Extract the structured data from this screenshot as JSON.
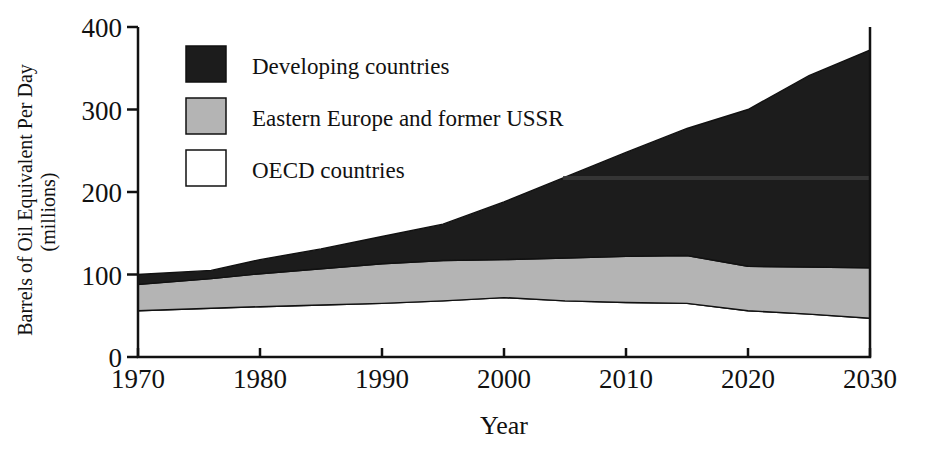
{
  "chart_data": {
    "type": "area",
    "title": "",
    "subtitle": "",
    "xlabel": "Year",
    "ylabel": "Barrels of Oil Equivalent Per Day (millions)",
    "ylabel_line1": "Barrels of Oil Equivalent Per Day",
    "ylabel_line2": "(millions)",
    "stacked": true,
    "stack_order_bottom_to_top": [
      "OECD countries",
      "Eastern Europe and former USSR",
      "Developing countries"
    ],
    "xlim": [
      1970,
      2030
    ],
    "ylim": [
      0,
      400
    ],
    "xticks": [
      1970,
      1980,
      1990,
      2000,
      2010,
      2020,
      2030
    ],
    "xtick_labels": [
      "1970",
      "1980",
      "1990",
      "2000",
      "2010",
      "2020",
      "2030"
    ],
    "yticks": [
      0,
      100,
      200,
      300,
      400
    ],
    "ytick_labels": [
      "0",
      "100",
      "200",
      "300",
      "400"
    ],
    "grid": false,
    "legend_position": "upper-left-inside",
    "x": [
      1970,
      1976,
      1980,
      1985,
      1990,
      1995,
      2000,
      2005,
      2010,
      2015,
      2020,
      2025,
      2030
    ],
    "series": [
      {
        "name": "OECD countries",
        "color": "#ffffff",
        "values": [
          56,
          59,
          61,
          63,
          65,
          68,
          72,
          68,
          66,
          65,
          56,
          52,
          47
        ]
      },
      {
        "name": "Eastern Europe and former USSR",
        "color": "#b4b4b4",
        "values": [
          32,
          36,
          40,
          44,
          48,
          49,
          46,
          52,
          56,
          58,
          54,
          57,
          61
        ]
      },
      {
        "name": "Developing countries",
        "color": "#1c1c1c",
        "values": [
          12,
          10,
          17,
          24,
          33,
          44,
          70,
          98,
          126,
          154,
          190,
          232,
          264
        ]
      }
    ],
    "cumulative_tops": {
      "oecd": [
        56,
        59,
        61,
        63,
        65,
        68,
        72,
        68,
        66,
        65,
        56,
        52,
        47
      ],
      "oecd_plus_eastern": [
        88,
        95,
        101,
        107,
        113,
        117,
        118,
        120,
        122,
        123,
        110,
        109,
        108
      ],
      "total": [
        100,
        105,
        118,
        131,
        146,
        161,
        188,
        218,
        248,
        277,
        300,
        341,
        372
      ]
    },
    "legend": [
      {
        "label": "Developing countries",
        "swatch": "#1c1c1c"
      },
      {
        "label": "Eastern Europe and former USSR",
        "swatch": "#b4b4b4"
      },
      {
        "label": "OECD countries",
        "swatch": "#ffffff"
      }
    ]
  }
}
